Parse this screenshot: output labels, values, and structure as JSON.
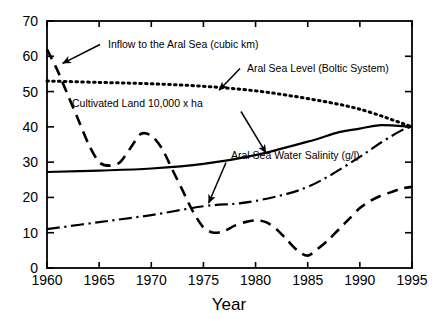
{
  "chart_data": {
    "type": "line",
    "title": "",
    "xlabel": "Year",
    "ylabel": "",
    "xlim": [
      1960,
      1995
    ],
    "ylim": [
      0,
      70
    ],
    "grid": false,
    "legend_position": "inline-annotations",
    "xticks": [
      1960,
      1965,
      1970,
      1975,
      1980,
      1985,
      1990,
      1995
    ],
    "yticks": [
      0,
      10,
      20,
      30,
      40,
      50,
      60,
      70
    ],
    "xtick_labels": [
      "1960",
      "1965",
      "1970",
      "1975",
      "1980",
      "1985",
      "1990",
      "1995"
    ],
    "ytick_labels": [
      "0",
      "10",
      "20",
      "30",
      "40",
      "50",
      "60",
      "70"
    ],
    "series": [
      {
        "name": "Inflow to the Aral Sea (cubic km)",
        "style": "dashed",
        "x": [
          1960,
          1961,
          1962,
          1963,
          1964,
          1965,
          1966,
          1967,
          1968,
          1969,
          1970,
          1971,
          1972,
          1973,
          1974,
          1975,
          1976,
          1977,
          1978,
          1979,
          1980,
          1981,
          1982,
          1983,
          1984,
          1985,
          1986,
          1987,
          1988,
          1989,
          1990,
          1991,
          1992,
          1993,
          1994,
          1995
        ],
        "values": [
          62,
          56,
          49,
          42,
          35,
          30,
          29,
          30,
          34,
          38,
          37.5,
          34,
          28,
          22,
          16,
          11.5,
          10,
          10.5,
          12,
          13,
          13.5,
          13,
          11,
          8,
          5,
          3.5,
          5.5,
          8,
          11,
          14,
          17,
          19,
          20.5,
          21.5,
          22.5,
          23
        ]
      },
      {
        "name": "Aral Sea Level (Boltic System)",
        "style": "dotted",
        "x": [
          1960,
          1965,
          1970,
          1975,
          1980,
          1985,
          1990,
          1995
        ],
        "values": [
          53,
          52.6,
          52.2,
          51.5,
          50.2,
          48.0,
          45.0,
          40.0
        ]
      },
      {
        "name": "Cultivated Land 10,000 x ha",
        "style": "solid",
        "x": [
          1960,
          1965,
          1970,
          1975,
          1980,
          1985,
          1988,
          1990,
          1992,
          1995
        ],
        "values": [
          27.2,
          27.6,
          28.2,
          29.5,
          32.0,
          35.8,
          38.5,
          39.5,
          40.5,
          40.0
        ]
      },
      {
        "name": "Aral Sea Water Salinity (g/l)",
        "style": "dash-dot",
        "x": [
          1960,
          1965,
          1970,
          1975,
          1978,
          1980,
          1983,
          1985,
          1987,
          1990,
          1992,
          1994,
          1995
        ],
        "values": [
          11,
          13,
          15,
          17.5,
          18.2,
          19.0,
          21.0,
          23.0,
          26.0,
          31.5,
          35.5,
          39.0,
          40.0
        ]
      }
    ],
    "annotations": [
      {
        "label": "Inflow to the Aral Sea (cubic km)",
        "target_x": 1961.5,
        "target_y": 58
      },
      {
        "label": "Aral Sea Level (Boltic System)",
        "target_x": 1976.5,
        "target_y": 50.4
      },
      {
        "label": "Cultivated Land 10,000 x ha",
        "target_x": 1981.0,
        "target_y": 32.6
      },
      {
        "label": "Aral Sea Water Salinity (g/l)",
        "target_x": 1975.5,
        "target_y": 18.4
      }
    ]
  },
  "axes": {
    "x_axis_title": "Year"
  }
}
